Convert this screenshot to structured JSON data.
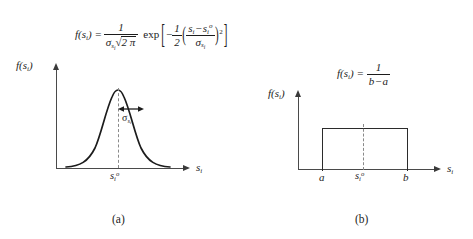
{
  "figure": {
    "background": "#ffffff",
    "ink": "#1c1c1c",
    "axis_color": "#4a4a4a",
    "dash_color": "#8a8a8a"
  },
  "panel_a": {
    "caption": "(a)",
    "distribution": "gaussian",
    "formula": {
      "lhs": "f(s",
      "lhs_sub": "i",
      "lhs_close": ") =",
      "numerator": "1",
      "den_sigma": "σ",
      "den_sigma_sub": "s",
      "den_sigma_subsub": "i",
      "den_radical": "√",
      "den_radicand": "2 π",
      "exp_label": "exp",
      "bracket_open": "[",
      "bracket_close": "]",
      "minus": "−",
      "half_num": "1",
      "half_den": "2",
      "paren_open": "(",
      "paren_close": ")",
      "inner_num_a": "s",
      "inner_num_a_sub": "i",
      "inner_minus": "−",
      "inner_num_b": "s",
      "inner_num_b_sub": "i",
      "inner_num_b_sup": "o",
      "inner_den_sigma": "σ",
      "inner_den_sigma_sub": "s",
      "inner_den_sigma_subsub": "i",
      "power": "2"
    },
    "y_axis_label": {
      "f": "f(s",
      "sub": "i",
      "close": ")"
    },
    "x_axis_label": {
      "s": "s",
      "sub": "i"
    },
    "mean_tick": {
      "s": "s",
      "sub": "i",
      "sup": "o"
    },
    "sigma_label": {
      "sigma": "σ",
      "sub": "s",
      "subsub": "i"
    },
    "sigma_arrow": "double-headed"
  },
  "panel_b": {
    "caption": "(b)",
    "distribution": "uniform",
    "formula": {
      "lhs": "f(s",
      "lhs_sub": "i",
      "lhs_close": ") =",
      "numerator": "1",
      "den_b": "b",
      "den_minus": "−",
      "den_a": "a"
    },
    "y_axis_label": {
      "f": "f(s",
      "sub": "i",
      "close": ")"
    },
    "x_axis_label": {
      "s": "s",
      "sub": "i"
    },
    "ticks": {
      "lower": "a",
      "mean": {
        "s": "s",
        "sub": "i",
        "sup": "o"
      },
      "upper": "b"
    }
  }
}
